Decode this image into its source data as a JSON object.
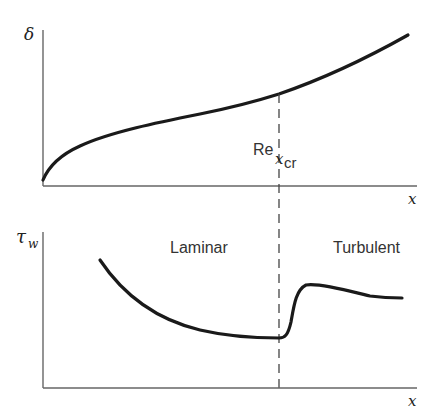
{
  "figure": {
    "top_plot": {
      "y_label": "δ",
      "x_label": "x",
      "curve": "boundary-layer-thickness"
    },
    "bottom_plot": {
      "y_label": "τ",
      "y_label_sub": "w",
      "x_label": "x",
      "region_left": "Laminar",
      "region_right": "Turbulent",
      "curve": "wall-shear-stress"
    },
    "transition": {
      "label_main": "Re",
      "label_sub_x": "x",
      "label_sub_cr": "cr"
    }
  },
  "colors": {
    "curve": "#1a1a1a",
    "axis": "#555555",
    "dash": "#444444"
  }
}
